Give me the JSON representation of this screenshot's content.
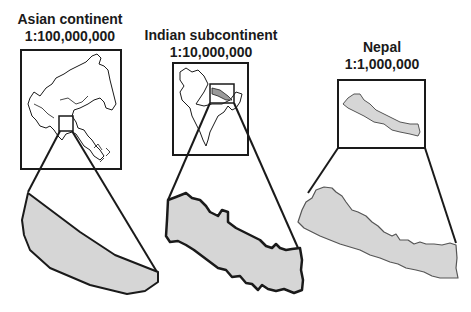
{
  "figure": {
    "panels": [
      {
        "name": "Asian continent",
        "scale": "1:100,000,000"
      },
      {
        "name": "Indian subcontinent",
        "scale": "1:10,000,000"
      },
      {
        "name": "Nepal",
        "scale": "1:1,000,000"
      }
    ]
  },
  "colors": {
    "stroke": "#1a1a1a",
    "fill": "#d6d6d6",
    "background": "#ffffff"
  }
}
